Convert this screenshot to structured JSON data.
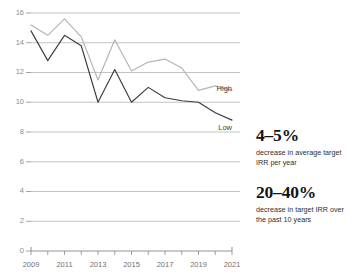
{
  "chart_data": {
    "type": "line",
    "title": "",
    "xlabel": "",
    "ylabel": "",
    "x": [
      2009,
      2010,
      2011,
      2012,
      2013,
      2014,
      2015,
      2016,
      2017,
      2018,
      2019,
      2020,
      2021
    ],
    "xtick_labels": [
      "2009",
      "2011",
      "2013",
      "2015",
      "2017",
      "2019",
      "2021"
    ],
    "xtick_values": [
      2009,
      2011,
      2013,
      2015,
      2017,
      2019,
      2021
    ],
    "xlim": [
      2009,
      2021
    ],
    "ytick_labels": [
      "0",
      "2",
      "4",
      "6",
      "8",
      "10",
      "12",
      "14",
      "16"
    ],
    "ytick_values": [
      0,
      2,
      4,
      6,
      8,
      10,
      12,
      14,
      16
    ],
    "ylim": [
      0,
      16
    ],
    "grid": true,
    "legend_position": "inline-right",
    "series": [
      {
        "name": "High",
        "color": "#b4b4b4",
        "values": [
          15.2,
          14.5,
          15.6,
          14.4,
          11.5,
          14.2,
          12.1,
          12.7,
          12.9,
          12.3,
          10.8,
          11.1,
          10.8
        ]
      },
      {
        "name": "Low",
        "color": "#3c3c3c",
        "values": [
          14.8,
          12.8,
          14.5,
          13.8,
          10.0,
          12.2,
          10.0,
          11.0,
          10.3,
          10.1,
          10.0,
          9.3,
          8.8
        ]
      }
    ]
  },
  "stats": {
    "items": [
      {
        "value": "4–5%",
        "description": "decrease in average target IRR per year"
      },
      {
        "value": "20–40%",
        "description": "decrease in target IRR over the past 10 years"
      }
    ]
  }
}
